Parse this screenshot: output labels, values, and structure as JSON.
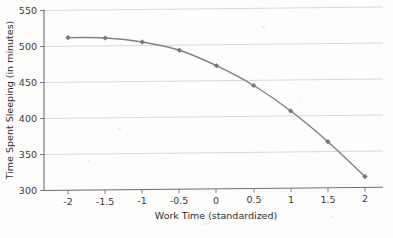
{
  "chart_data": {
    "type": "line",
    "title": "",
    "subtitle": "",
    "xlabel": "Work Time (standardized)",
    "ylabel": "Time Spent Sleeping (in minutes)",
    "xlim": [
      -2.15,
      2.2
    ],
    "ylim": [
      300,
      550
    ],
    "xticks": [
      -2,
      -1.5,
      -1,
      -0.5,
      0,
      0.5,
      1,
      1.5,
      2
    ],
    "xtick_labels": [
      "-2",
      "-1.5",
      "-1",
      "-0.5",
      "0",
      "0.5",
      "1",
      "1.5",
      "2"
    ],
    "yticks": [
      300,
      350,
      400,
      450,
      500,
      550
    ],
    "ytick_labels": [
      "300",
      "350",
      "400",
      "450",
      "500",
      "550"
    ],
    "grid": true,
    "grid_axis": "y",
    "legend": false,
    "legend_position": "none",
    "markers": "diamond",
    "series": [
      {
        "name": "Time Spent Sleeping",
        "color": "#7a7f8c",
        "x": [
          -2,
          -1.5,
          -1,
          -0.5,
          0,
          0.5,
          1,
          1.5,
          2
        ],
        "values": [
          512,
          511,
          505,
          493,
          471,
          443,
          407,
          364,
          315
        ]
      }
    ]
  },
  "colors": {
    "line": "#7a7f8c",
    "marker": "#6e7585",
    "grid": "#c9c9c9",
    "axis": "#6f6f6f",
    "text": "#2e2e2e",
    "background": "#fdfdfc"
  },
  "axis": {
    "x_title": "Work Time (standardized)",
    "y_title": "Time Spent Sleeping (in minutes)"
  }
}
